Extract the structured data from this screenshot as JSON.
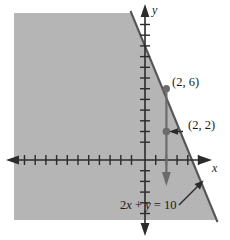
{
  "figure": {
    "type": "inequality-graph",
    "colors": {
      "shade": "#b5b5b5",
      "line": "#555555",
      "axis": "#2b2b2b",
      "point": "#6b6b6b",
      "background": "#ffffff"
    },
    "axes": {
      "x_label": "x",
      "y_label": "y",
      "x_axis_y_pixel": 160,
      "y_axis_x_pixel": 145,
      "tick_spacing_px": 10.7,
      "x_ticks_left": 12,
      "x_ticks_right": 6,
      "y_ticks_up": 13,
      "y_ticks_down": 6
    },
    "boundary_line": {
      "equation_text": "2x + y = 10",
      "equation_parts": {
        "coef": "2",
        "var1": "x",
        "plus": " + ",
        "var2": "y",
        "eq": " = ",
        "rhs": "10"
      },
      "y_intercept": 10,
      "x_intercept": 5,
      "slope": -2,
      "style": "solid"
    },
    "points": [
      {
        "name": "point-on-line",
        "label": "(2, 6)",
        "x": 2,
        "y": 6
      },
      {
        "name": "test-point",
        "label": "(2, 2)",
        "x": 2,
        "y": 2
      }
    ],
    "arrows": [
      {
        "name": "downward-shade-arrow",
        "from": "(2, 6)",
        "to": "below (2, -2)",
        "direction": "down"
      },
      {
        "name": "test-point-leader",
        "label": "(2, 2)",
        "direction": "left"
      },
      {
        "name": "equation-leader",
        "label": "2x + y = 10",
        "direction": "up-right"
      }
    ],
    "shaded_region": {
      "inequality": "2x + y ≤ 10",
      "side": "below-left"
    }
  }
}
